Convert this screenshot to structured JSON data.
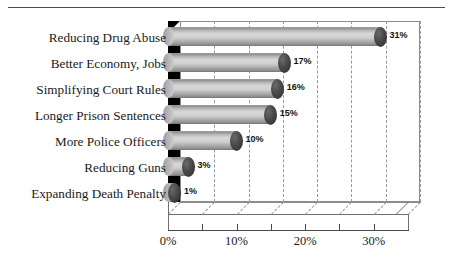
{
  "chart_data": {
    "type": "bar",
    "orientation": "horizontal",
    "title": "",
    "subtitle": "",
    "xlabel": "",
    "ylabel": "",
    "categories": [
      "Reducing Drug Abuse",
      "Better Economy, Jobs",
      "Simplifying Court Rules",
      "Longer Prison Sentences",
      "More Police Officers",
      "Reducing Guns",
      "Expanding Death Penalty"
    ],
    "values": [
      31,
      17,
      16,
      15,
      10,
      3,
      1
    ],
    "value_labels": [
      "31%",
      "17%",
      "16%",
      "15%",
      "10%",
      "3%",
      "1%"
    ],
    "xlim": [
      0,
      35
    ],
    "xticks": [
      0,
      5,
      10,
      15,
      20,
      25,
      30,
      35
    ],
    "xtick_labels": [
      "0%",
      "",
      "10%",
      "",
      "20%",
      "",
      "30%",
      ""
    ],
    "grid": true,
    "grid_axis": "x",
    "legend": "none",
    "style": "3d-cylinder",
    "colors": {
      "bar_fill": "#cfcfcf",
      "bar_highlight": "#d8d8d8",
      "bar_shadow": "#8a8a8a",
      "end_cap": "#2b2b2b",
      "side_wall": "#000000",
      "gridline": "#9a9a9a",
      "axis": "#4a4a4a",
      "text": "#1a1a1a",
      "background": "#ffffff"
    }
  }
}
